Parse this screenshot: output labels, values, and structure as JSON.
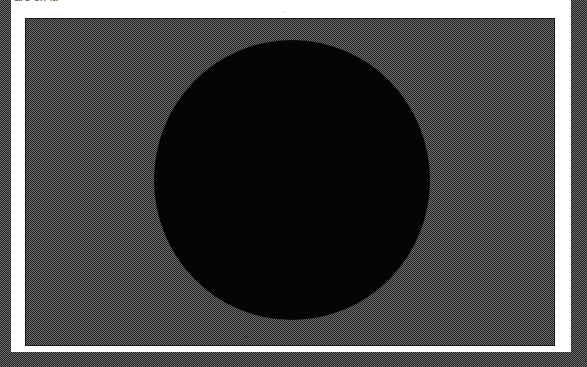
{
  "document": {
    "kind": "scanned-photograph-figure",
    "width_px": 587,
    "height_px": 367
  },
  "caption": {
    "text": "are on it.",
    "note": "clipped at top edge of frame"
  },
  "photograph": {
    "label": "photographic plate",
    "background_tone": "halftone gray",
    "subject": "large black disc"
  },
  "colors": {
    "paper_white": "#ffffff",
    "halftone_gray": "#6b6b6b",
    "halftone_dot": "#181818",
    "plate_rule": "#1d1d1d",
    "disc_black": "#050505",
    "caption_ink": "#3a3a3a"
  },
  "geometry": {
    "mat": {
      "x": 11,
      "y": 0,
      "w": 560,
      "h": 352
    },
    "plate": {
      "x": 25,
      "y": 18,
      "w": 530,
      "h": 328
    },
    "disc": {
      "cx": 291,
      "cy": 179,
      "w": 276,
      "h": 280
    }
  },
  "artifacts": {
    "speck_top": "dust speck",
    "speck_lower": "dust speck"
  }
}
